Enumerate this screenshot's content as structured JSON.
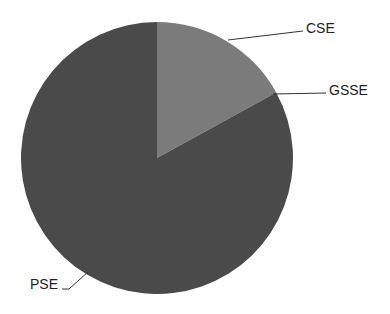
{
  "chart_data": {
    "type": "pie",
    "title": "",
    "start_angle_deg": 0,
    "direction": "clockwise",
    "labels": [
      "CSE",
      "GSSE",
      "PSE"
    ],
    "values": [
      17,
      0,
      83
    ],
    "unit": "percent (estimated from slice angles)",
    "colors": [
      "#7b7b7b",
      "#4d4d4d",
      "#4a4a4a"
    ],
    "legend": "none (leader-line labels)",
    "geometry": {
      "cx": 157,
      "cy": 158,
      "r": 136
    },
    "label_positions": [
      {
        "label": "CSE",
        "x": 306,
        "y": 33,
        "line": [
          [
            228,
            40
          ],
          [
            303,
            31
          ]
        ]
      },
      {
        "label": "GSSE",
        "x": 329,
        "y": 95,
        "line": [
          [
            273,
            94
          ],
          [
            326,
            93
          ]
        ]
      },
      {
        "label": "PSE",
        "x": 30,
        "y": 289,
        "line": [
          [
            88,
            272
          ],
          [
            69,
            289
          ],
          [
            62,
            289
          ]
        ]
      }
    ]
  },
  "labels": {
    "cse": "CSE",
    "gsse": "GSSE",
    "pse": "PSE"
  }
}
